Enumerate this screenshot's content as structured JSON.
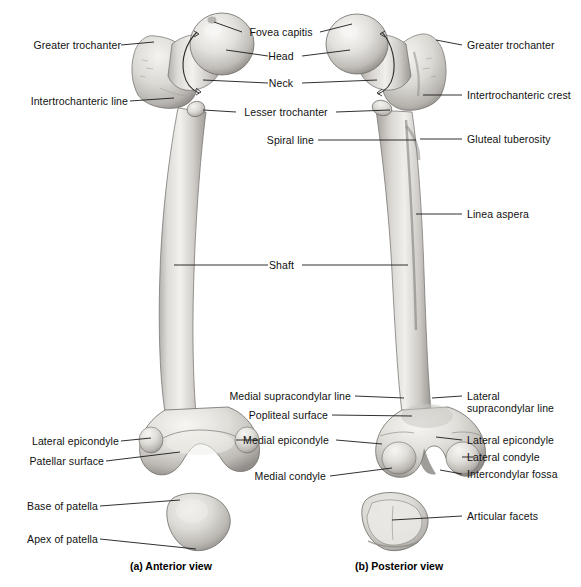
{
  "figure": {
    "background": "#ffffff",
    "line_color": "#1a1a1a",
    "bone_fill": "#d8d6d2",
    "bone_shade": "#9b9894"
  },
  "captions": [
    {
      "key": "anterior",
      "text": "(a) Anterior view",
      "x": 130,
      "y": 562
    },
    {
      "key": "posterior",
      "text": "(b) Posterior view",
      "x": 355,
      "y": 562
    }
  ],
  "labels": {
    "left": [
      {
        "key": "greater-trochanter-anterior",
        "text": "Greater trochanter",
        "x": 14,
        "y": 39,
        "anchor_x": 121,
        "anchor_y": 45,
        "tip_x": 154,
        "tip_y": 42
      },
      {
        "key": "intertrochanteric-line",
        "text": "Intertrochanteric line",
        "x": 14,
        "y": 95,
        "anchor_x": 130,
        "anchor_y": 101,
        "tip_x": 174,
        "tip_y": 98
      },
      {
        "key": "lateral-epicondyle-anterior",
        "text": "Lateral epicondyle",
        "x": 14,
        "y": 435,
        "anchor_x": 121,
        "anchor_y": 441,
        "tip_x": 151,
        "tip_y": 438
      },
      {
        "key": "patellar-surface",
        "text": "Patellar surface",
        "x": 14,
        "y": 455,
        "anchor_x": 106,
        "anchor_y": 461,
        "tip_x": 180,
        "tip_y": 458
      },
      {
        "key": "base-of-patella",
        "text": "Base of patella",
        "x": 14,
        "y": 500,
        "anchor_x": 100,
        "anchor_y": 506,
        "tip_x": 180,
        "tip_y": 500
      },
      {
        "key": "apex-of-patella",
        "text": "Apex of patella",
        "x": 14,
        "y": 533,
        "anchor_x": 100,
        "anchor_y": 539,
        "tip_x": 196,
        "tip_y": 549
      }
    ],
    "center": [
      {
        "key": "fovea-capitis",
        "text": "Fovea capitis",
        "x": 247,
        "y": 26,
        "left_x": 242,
        "left_y": 32,
        "left_tip_x": 214,
        "left_tip_y": 20,
        "right_x": 320,
        "right_y": 32,
        "right_tip_x": 358,
        "right_tip_y": 20
      },
      {
        "key": "head",
        "text": "Head",
        "x": 272,
        "y": 50,
        "left_x": 268,
        "left_y": 56,
        "left_tip_x": 222,
        "left_tip_y": 50,
        "right_x": 302,
        "right_y": 56,
        "right_tip_x": 350,
        "right_tip_y": 50
      },
      {
        "key": "neck",
        "text": "Neck",
        "x": 272,
        "y": 77,
        "left_x": 268,
        "left_y": 83,
        "left_tip_x": 203,
        "left_tip_y": 76,
        "right_x": 302,
        "right_y": 83,
        "right_tip_x": 372,
        "right_tip_y": 76
      },
      {
        "key": "lesser-trochanter",
        "text": "Lesser trochanter",
        "x": 241,
        "y": 106,
        "left_x": 236,
        "left_y": 112,
        "left_tip_x": 196,
        "left_tip_y": 112,
        "right_x": 336,
        "right_y": 112,
        "right_tip_x": 378,
        "right_tip_y": 110
      },
      {
        "key": "spiral-line",
        "text": "Spiral line",
        "x": 263,
        "y": 134,
        "left_x": 0,
        "left_y": 0,
        "left_tip_x": 0,
        "left_tip_y": 0,
        "right_x": 318,
        "right_y": 140,
        "right_tip_x": 213,
        "right_tip_y": 140
      },
      {
        "key": "shaft",
        "text": "Shaft",
        "x": 272,
        "y": 259,
        "left_x": 268,
        "left_y": 265,
        "left_tip_x": 174,
        "left_tip_y": 265,
        "right_x": 302,
        "right_y": 265,
        "right_tip_x": 400,
        "right_tip_y": 265
      },
      {
        "key": "medial-supracondylar-line",
        "text": "Medial supracondylar line",
        "x": 226,
        "y": 390,
        "left_x": 0,
        "left_y": 0,
        "left_tip_x": 0,
        "left_tip_y": 0,
        "right_x": 355,
        "right_y": 396,
        "right_tip_x": 387,
        "right_tip_y": 396
      },
      {
        "key": "popliteal-surface",
        "text": "Popliteal surface",
        "x": 249,
        "y": 409,
        "left_x": 0,
        "left_y": 0,
        "left_tip_x": 0,
        "left_tip_y": 0,
        "right_x": 332,
        "right_y": 415,
        "right_tip_x": 400,
        "right_tip_y": 415
      },
      {
        "key": "medial-epicondyle",
        "text": "Medial epicondyle",
        "x": 241,
        "y": 434,
        "left_x": 236,
        "left_y": 440,
        "left_tip_x": 208,
        "left_tip_y": 440,
        "right_x": 336,
        "right_y": 440,
        "right_tip_x": 375,
        "right_tip_y": 440
      },
      {
        "key": "medial-condyle",
        "text": "Medial condyle",
        "x": 251,
        "y": 470,
        "left_x": 0,
        "left_y": 0,
        "left_tip_x": 0,
        "left_tip_y": 0,
        "right_x": 330,
        "right_y": 476,
        "right_tip_x": 387,
        "right_tip_y": 476
      }
    ],
    "right": [
      {
        "key": "greater-trochanter-posterior",
        "text": "Greater trochanter",
        "x": 467,
        "y": 39,
        "anchor_x": 462,
        "anchor_y": 45,
        "tip_x": 428,
        "tip_y": 40
      },
      {
        "key": "intertrochanteric-crest",
        "text": "Intertrochanteric crest",
        "x": 467,
        "y": 89,
        "anchor_x": 462,
        "anchor_y": 95,
        "tip_x": 423,
        "tip_y": 95
      },
      {
        "key": "gluteal-tuberosity",
        "text": "Gluteal tuberosity",
        "x": 467,
        "y": 133,
        "anchor_x": 462,
        "anchor_y": 139,
        "tip_x": 424,
        "tip_y": 139
      },
      {
        "key": "linea-aspera",
        "text": "Linea aspera",
        "x": 467,
        "y": 208,
        "anchor_x": 462,
        "anchor_y": 214,
        "tip_x": 417,
        "tip_y": 214
      },
      {
        "key": "lateral-supracondylar-line",
        "text": "Lateral supracondylar line",
        "x": 467,
        "y": 390,
        "anchor_x": 462,
        "anchor_y": 396,
        "tip_x": 419,
        "tip_y": 396,
        "wrap": true
      },
      {
        "key": "lateral-epicondyle-posterior",
        "text": "Lateral epicondyle",
        "x": 467,
        "y": 434,
        "anchor_x": 462,
        "anchor_y": 440,
        "tip_x": 428,
        "tip_y": 440
      },
      {
        "key": "lateral-condyle",
        "text": "Lateral condyle",
        "x": 467,
        "y": 451,
        "anchor_x": 462,
        "anchor_y": 457,
        "tip_x": 424,
        "tip_y": 457
      },
      {
        "key": "intercondylar-fossa",
        "text": "Intercondylar fossa",
        "x": 467,
        "y": 468,
        "anchor_x": 462,
        "anchor_y": 474,
        "tip_x": 404,
        "tip_y": 474
      },
      {
        "key": "articular-facets",
        "text": "Articular facets",
        "x": 467,
        "y": 510,
        "anchor_x": 462,
        "anchor_y": 516,
        "tip_x": 390,
        "tip_y": 519
      }
    ]
  }
}
